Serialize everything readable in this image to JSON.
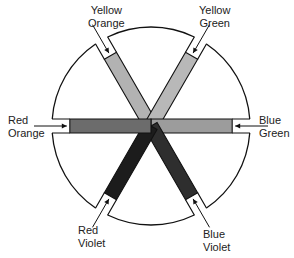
{
  "diagram": {
    "type": "color-wheel-intermediate-colors",
    "center": [
      151,
      126
    ],
    "radius": 99,
    "spokes": [
      {
        "name": "Yellow Orange",
        "line1": "Yellow",
        "line2": "Orange",
        "angle": 240,
        "fill": "#b2b2b2"
      },
      {
        "name": "Yellow Green",
        "line1": "Yellow",
        "line2": "Green",
        "angle": 300,
        "fill": "#b8b8b8"
      },
      {
        "name": "Blue Green",
        "line1": "Blue",
        "line2": "Green",
        "angle": 0,
        "fill": "#9c9c9c"
      },
      {
        "name": "Blue Violet",
        "line1": "Blue",
        "line2": "Violet",
        "angle": 60,
        "fill": "#2e2e2e"
      },
      {
        "name": "Red Violet",
        "line1": "Red",
        "line2": "Violet",
        "angle": 120,
        "fill": "#1c1c1c"
      },
      {
        "name": "Red Orange",
        "line1": "Red",
        "line2": "Orange",
        "angle": 180,
        "fill": "#6c6c6c"
      }
    ]
  },
  "labels": {
    "yellow_orange": {
      "line1": "Yellow",
      "line2": "Orange"
    },
    "yellow_green": {
      "line1": "Yellow",
      "line2": "Green"
    },
    "blue_green": {
      "line1": "Blue",
      "line2": "Green"
    },
    "blue_violet": {
      "line1": "Blue",
      "line2": "Violet"
    },
    "red_violet": {
      "line1": "Red",
      "line2": "Violet"
    },
    "red_orange": {
      "line1": "Red",
      "line2": "Orange"
    }
  }
}
